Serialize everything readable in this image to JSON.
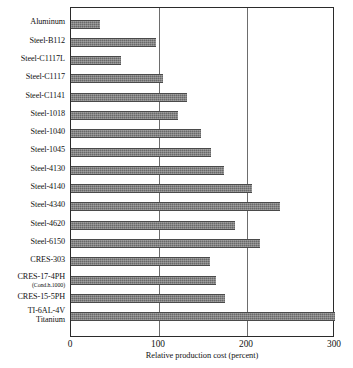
{
  "chart_data": {
    "type": "bar",
    "orientation": "horizontal",
    "title": "",
    "xlabel": "Relative production cost (percent)",
    "ylabel": "",
    "xlim": [
      0,
      300
    ],
    "xticks": [
      0,
      100,
      200,
      300
    ],
    "xtick_labels": [
      "0",
      "100",
      "200",
      "300"
    ],
    "grid": "vertical gridlines at 100 and 200",
    "gridlines": [
      100,
      200
    ],
    "legend": "none",
    "bar_color": "#696969",
    "frame_color": "#2b2b2b",
    "categories": [
      "Aluminum",
      "Steel-B112",
      "Steel-C1117L",
      "Steel-C1117",
      "Steel-C1141",
      "Steel-1018",
      "Steel-1040",
      "Steel-1045",
      "Steel-4130",
      "Steel-4140",
      "Steel-4340",
      "Steel-4620",
      "Steel-6150",
      "CRES-303",
      "CRES-17-4PH",
      "CRES-15-5PH",
      "TI-6AL-4V"
    ],
    "category_sublabels": [
      "",
      "",
      "",
      "",
      "",
      "",
      "",
      "",
      "",
      "",
      "",
      "",
      "",
      "",
      "(Cond.h.1000)",
      "",
      "Titanium"
    ],
    "values": [
      33,
      97,
      57,
      104,
      132,
      122,
      148,
      159,
      174,
      206,
      238,
      186,
      215,
      158,
      165,
      175,
      300
    ]
  },
  "axis": {
    "xlabel": "Relative production cost (percent)"
  }
}
